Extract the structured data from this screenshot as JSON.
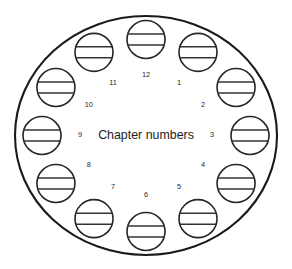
{
  "figure": {
    "center_caption": "Chapter numbers",
    "boundary": {
      "shape": "ellipse",
      "cx": 146,
      "cy": 135.5,
      "rx": 131,
      "ry": 119.5,
      "stroke_color": "#1a1a1a"
    },
    "token": {
      "radius": 19,
      "stroke_color": "#262626",
      "fill_color": "#ffffff",
      "line_color": "#333333",
      "line_count": 2,
      "line_offsets": [
        -5.5,
        5.5
      ]
    },
    "ring": {
      "count": 12,
      "token_ring_rx": 104,
      "token_ring_ry": 96,
      "label_ring_rx": 66,
      "label_ring_ry": 60
    },
    "chapters": [
      {
        "number": "1",
        "angle_deg": -60
      },
      {
        "number": "2",
        "angle_deg": -30
      },
      {
        "number": "3",
        "angle_deg": 0
      },
      {
        "number": "4",
        "angle_deg": 30
      },
      {
        "number": "5",
        "angle_deg": 60
      },
      {
        "number": "6",
        "angle_deg": 90
      },
      {
        "number": "7",
        "angle_deg": 120
      },
      {
        "number": "8",
        "angle_deg": 150
      },
      {
        "number": "9",
        "angle_deg": 180
      },
      {
        "number": "10",
        "angle_deg": 210
      },
      {
        "number": "11",
        "angle_deg": 240
      },
      {
        "number": "12",
        "angle_deg": 270
      }
    ]
  }
}
